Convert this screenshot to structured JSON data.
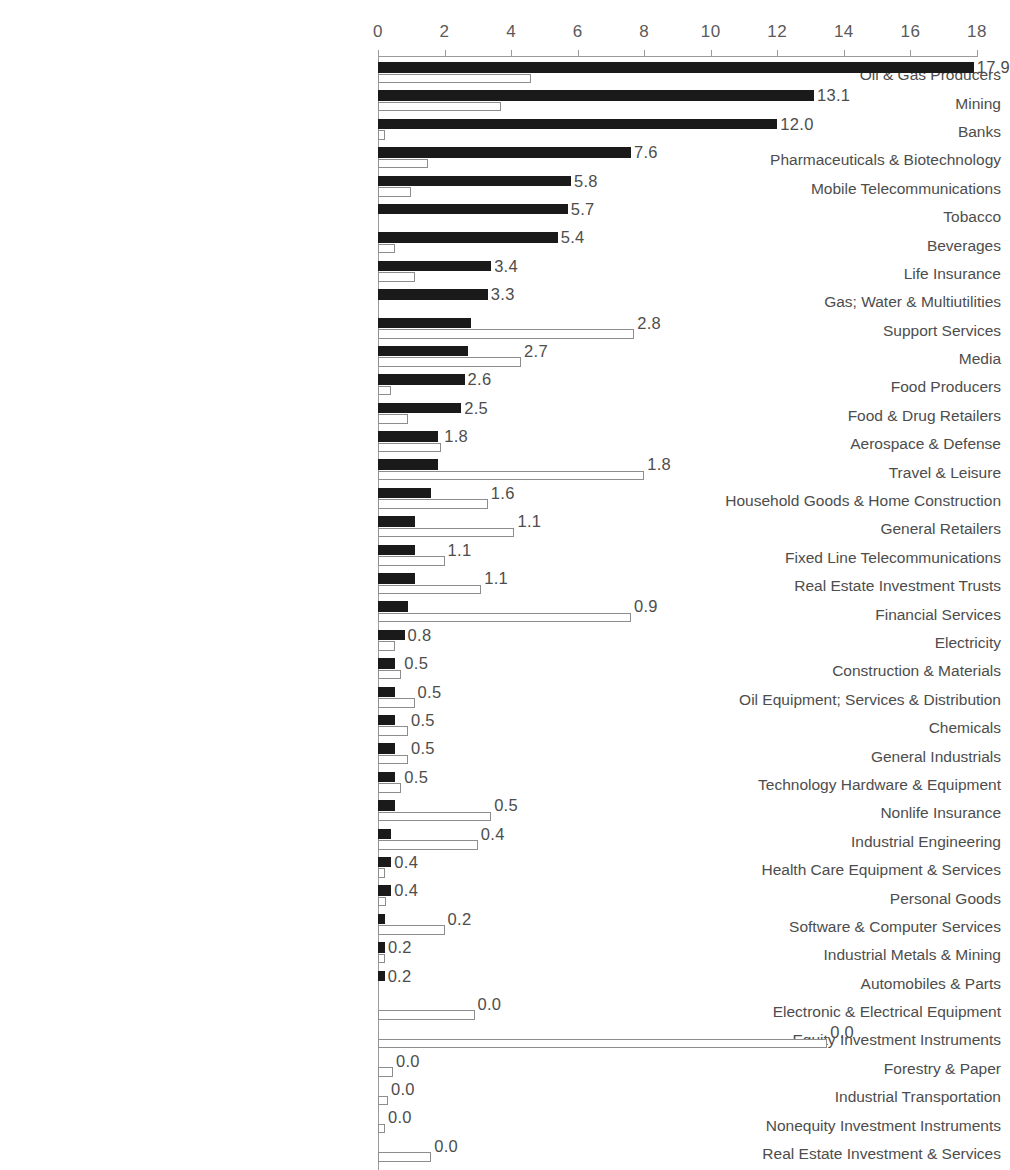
{
  "chart_data": {
    "type": "bar",
    "orientation": "horizontal",
    "title": "",
    "subtitle": "",
    "xlabel": "",
    "ylabel": "",
    "xlim": [
      0,
      18
    ],
    "xticks": [
      0,
      2,
      4,
      6,
      8,
      10,
      12,
      14,
      16,
      18
    ],
    "xtick_labels": [
      "0",
      "2",
      "4",
      "6",
      "8",
      "10",
      "12",
      "14",
      "16",
      "18"
    ],
    "grid": false,
    "legend": null,
    "value_label_format": "one-decimal",
    "colors": {
      "series_primary": "#1a1a1a",
      "series_secondary_fill": "#ffffff",
      "series_secondary_stroke": "#8d8d8d",
      "axis": "#9a9a9a",
      "text": "#4d4d4d"
    },
    "categories": [
      "Oil & Gas Producers",
      "Mining",
      "Banks",
      "Pharmaceuticals & Biotechnology",
      "Mobile Telecommunications",
      "Tobacco",
      "Beverages",
      "Life Insurance",
      "Gas; Water & Multiutilities",
      "Support Services",
      "Media",
      "Food Producers",
      "Food & Drug Retailers",
      "Aerospace & Defense",
      "Travel & Leisure",
      "Household Goods & Home Construction",
      "General Retailers",
      "Fixed Line Telecommunications",
      "Real Estate Investment Trusts",
      "Financial Services",
      "Electricity",
      "Construction & Materials",
      "Oil Equipment; Services & Distribution",
      "Chemicals",
      "General Industrials",
      "Technology Hardware & Equipment",
      "Nonlife Insurance",
      "Industrial Engineering",
      "Health Care Equipment & Services",
      "Personal Goods",
      "Software & Computer Services",
      "Industrial Metals & Mining",
      "Automobiles & Parts",
      "Electronic & Electrical Equipment",
      "Equity Investment Instruments",
      "Forestry & Paper",
      "Industrial Transportation",
      "Nonequity Investment Instruments",
      "Real Estate Investment & Services"
    ],
    "series": [
      {
        "name": "primary",
        "style": "filled",
        "labelled": true,
        "values": [
          17.9,
          13.1,
          12.0,
          7.6,
          5.8,
          5.7,
          5.4,
          3.4,
          3.3,
          2.8,
          2.7,
          2.6,
          2.5,
          1.8,
          1.8,
          1.6,
          1.1,
          1.1,
          1.1,
          0.9,
          0.8,
          0.5,
          0.5,
          0.5,
          0.5,
          0.5,
          0.5,
          0.4,
          0.4,
          0.4,
          0.2,
          0.2,
          0.2,
          0.0,
          0.0,
          0.0,
          0.0,
          0.0,
          0.0
        ],
        "value_labels": [
          "17.9",
          "13.1",
          "12.0",
          "7.6",
          "5.8",
          "5.7",
          "5.4",
          "3.4",
          "3.3",
          "2.8",
          "2.7",
          "2.6",
          "2.5",
          "1.8",
          "1.8",
          "1.6",
          "1.1",
          "1.1",
          "1.1",
          "0.9",
          "0.8",
          "0.5",
          "0.5",
          "0.5",
          "0.5",
          "0.5",
          "0.5",
          "0.4",
          "0.4",
          "0.4",
          "0.2",
          "0.2",
          "0.2",
          "0.0",
          "0.0",
          "0.0",
          "0.0",
          "0.0",
          "0.0"
        ]
      },
      {
        "name": "secondary",
        "style": "hollow",
        "labelled": false,
        "values": [
          4.6,
          3.7,
          0.15,
          1.5,
          1.0,
          0.0,
          0.5,
          1.1,
          0.0,
          7.7,
          4.3,
          0.4,
          0.9,
          1.9,
          8.0,
          3.3,
          4.1,
          2.0,
          3.1,
          7.6,
          0.5,
          0.7,
          1.1,
          0.9,
          0.9,
          0.7,
          3.4,
          3.0,
          0.2,
          0.25,
          2.0,
          0.2,
          0.0,
          2.9,
          13.5,
          0.45,
          0.3,
          0.2,
          1.6
        ]
      }
    ]
  },
  "layout": {
    "plot_left_px": 378,
    "plot_right_px": 977,
    "row_pitch_px": 28.4,
    "rows_top_px": 60
  }
}
